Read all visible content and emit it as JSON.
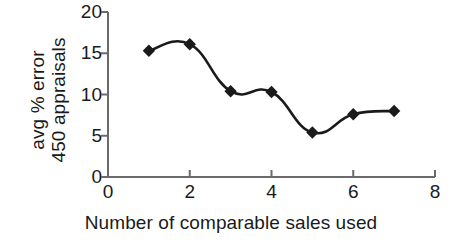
{
  "chart_data": {
    "type": "line",
    "title": "",
    "subtitle": "",
    "xlabel": "Number of comparable sales used",
    "ylabel": "avg % error\n450 appraisals",
    "ylabel_lines": [
      "avg % error",
      "450 appraisals"
    ],
    "x": [
      1,
      2,
      3,
      4,
      5,
      6,
      7
    ],
    "values": [
      15.3,
      16.1,
      10.4,
      10.3,
      5.4,
      7.6,
      8.0
    ],
    "series": [
      {
        "name": "avg % error",
        "x": [
          1,
          2,
          3,
          4,
          5,
          6,
          7
        ],
        "values": [
          15.3,
          16.1,
          10.4,
          10.3,
          5.4,
          7.6,
          8.0
        ]
      }
    ],
    "xlim": [
      0,
      8
    ],
    "ylim": [
      0,
      20
    ],
    "xticks": [
      0,
      2,
      4,
      6,
      8
    ],
    "xtick_labels": [
      "0",
      "2",
      "4",
      "6",
      "8"
    ],
    "yticks": [
      0,
      5,
      10,
      15,
      20
    ],
    "ytick_labels": [
      "0",
      "5",
      "10",
      "15",
      "20"
    ],
    "grid": false,
    "legend": false,
    "legend_position": "none",
    "marker": "diamond",
    "line_color": "#1a1a1a",
    "marker_color": "#1a1a1a",
    "axis_color": "#666666",
    "background_color": "#ffffff"
  }
}
